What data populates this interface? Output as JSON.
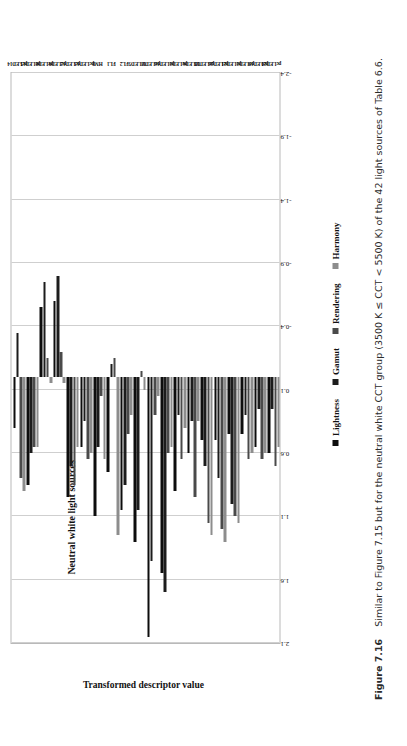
{
  "figure": {
    "caption_number": "Figure 7.16",
    "caption_text": "Similar to Figure 7.15 but for the neutral white CCT group (3500 K ≤ CCT < 5500 K) of the 42 light sources of Table 6.6."
  },
  "legend": {
    "items": [
      {
        "label": "Lightness",
        "color": "#0d0d0d"
      },
      {
        "label": "Gamut",
        "color": "#1c1c1c"
      },
      {
        "label": "Rendering",
        "color": "#4a4a4a"
      },
      {
        "label": "Harmony",
        "color": "#8d8d8d"
      }
    ]
  },
  "chart_data": {
    "type": "bar",
    "orientation": "horizontal",
    "title": "Neutral white light sources",
    "xlabel": "Transformed descriptor value",
    "ylabel": "",
    "xlim": [
      -2.4,
      2.1
    ],
    "grid": true,
    "legend_position": "top-right",
    "ticks": [
      "2.1",
      "1.6",
      "1.1",
      "0.6",
      "0.1",
      "-0.4",
      "-0.9",
      "-1.4",
      "-1.9",
      "-2.4"
    ],
    "tick_values": [
      2.1,
      1.6,
      1.1,
      0.6,
      0.1,
      -0.4,
      -0.9,
      -1.4,
      -1.9,
      -2.4
    ],
    "categories": [
      "pcLED14",
      "pcLED15",
      "pcLED8",
      "pcLED9",
      "pcLED12",
      "pcLED13",
      "HMI",
      "FL1",
      "FL2",
      "MLED5",
      "pcLED2",
      "pcLED16",
      "pcLED3",
      "MLED6",
      "pcLED23",
      "pcLED26",
      "pcLED21",
      "pcLED3",
      "pcLED19",
      "pcLED20"
    ],
    "series": [
      {
        "name": "Lightness",
        "color": "#0d0d0d",
        "values": [
          0.4,
          0.85,
          -0.55,
          -0.6,
          0.95,
          0.55,
          1.1,
          0.75,
          1.05,
          1.3,
          2.05,
          1.55,
          0.9,
          0.6,
          0.5,
          0.5,
          0.45,
          0.45,
          0.55,
          0.6
        ]
      },
      {
        "name": "Gamut",
        "color": "#1c1c1c",
        "values": [
          -0.35,
          0.6,
          -0.75,
          -0.8,
          0.7,
          0.35,
          0.55,
          -0.1,
          0.85,
          1.05,
          1.45,
          1.7,
          0.3,
          0.35,
          0.7,
          0.8,
          1.0,
          0.3,
          0.25,
          0.25
        ]
      },
      {
        "name": "Rendering",
        "color": "#4a4a4a",
        "values": [
          0.8,
          0.55,
          -0.15,
          -0.2,
          0.85,
          0.65,
          0.15,
          -0.15,
          0.45,
          -0.05,
          0.3,
          0.6,
          0.65,
          0.95,
          1.15,
          1.2,
          1.1,
          0.65,
          0.65,
          0.7
        ]
      },
      {
        "name": "Harmony",
        "color": "#8d8d8d",
        "values": [
          0.9,
          0.55,
          0.05,
          0.05,
          0.55,
          0.6,
          0.65,
          1.25,
          0.3,
          0.1,
          0.15,
          0.55,
          0.4,
          0.35,
          1.25,
          1.3,
          1.15,
          0.6,
          0.6,
          0.55
        ]
      }
    ]
  }
}
